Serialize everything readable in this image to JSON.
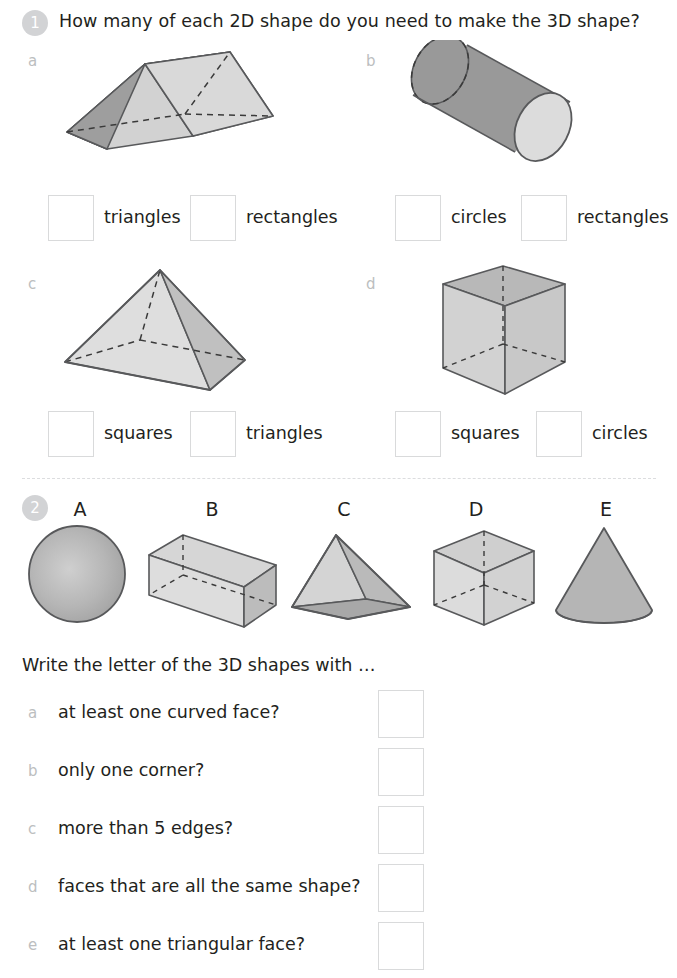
{
  "questions": [
    {
      "number": "1",
      "prompt": "How many of each 2D shape do you need to make the 3D shape?",
      "parts": [
        {
          "letter": "a",
          "shape": "triangular-prism",
          "answers": [
            {
              "label": "triangles",
              "value": ""
            },
            {
              "label": "rectangles",
              "value": ""
            }
          ]
        },
        {
          "letter": "b",
          "shape": "cylinder",
          "answers": [
            {
              "label": "circles",
              "value": ""
            },
            {
              "label": "rectangles",
              "value": ""
            }
          ]
        },
        {
          "letter": "c",
          "shape": "square-pyramid",
          "answers": [
            {
              "label": "squares",
              "value": ""
            },
            {
              "label": "triangles",
              "value": ""
            }
          ]
        },
        {
          "letter": "d",
          "shape": "cube",
          "answers": [
            {
              "label": "squares",
              "value": ""
            },
            {
              "label": "circles",
              "value": ""
            }
          ]
        }
      ]
    },
    {
      "number": "2",
      "prompt": "Write the letter of the 3D shapes with …",
      "shape_gallery": [
        {
          "letter": "A",
          "shape": "sphere"
        },
        {
          "letter": "B",
          "shape": "cuboid"
        },
        {
          "letter": "C",
          "shape": "tetrahedron"
        },
        {
          "letter": "D",
          "shape": "cube"
        },
        {
          "letter": "E",
          "shape": "cone"
        }
      ],
      "parts": [
        {
          "letter": "a",
          "text": "at least one curved face?",
          "value": ""
        },
        {
          "letter": "b",
          "text": "only one corner?",
          "value": ""
        },
        {
          "letter": "c",
          "text": "more than 5 edges?",
          "value": ""
        },
        {
          "letter": "d",
          "text": "faces that are all the same shape?",
          "value": ""
        },
        {
          "letter": "e",
          "text": "at least one triangular face?",
          "value": ""
        }
      ]
    }
  ],
  "colors": {
    "badge": "#d2d3d5",
    "text": "#231f20",
    "sublabel": "#bcbec0",
    "box_border": "#d9dadb",
    "divider": "#dcdddf",
    "shape_light": "#d8d8d8",
    "shape_mid": "#bdbdbd",
    "shape_dark": "#9a9a9a",
    "shape_outline": "#58595b"
  }
}
